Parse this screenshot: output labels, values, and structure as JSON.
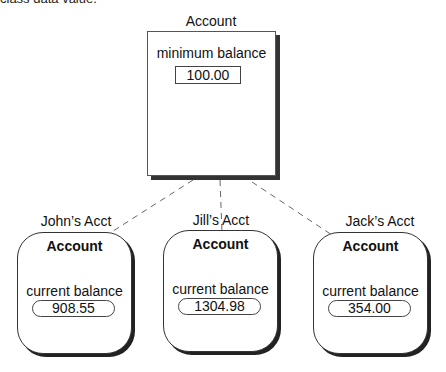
{
  "caption_fragment": "class data value.",
  "class": {
    "name": "Account",
    "attribute_label": "minimum balance",
    "attribute_value": "100.00"
  },
  "objects": [
    {
      "label": "John’s Acct",
      "class_name": "Account",
      "attribute_label": "current balance",
      "attribute_value": "908.55"
    },
    {
      "label": "Jill’s Acct",
      "class_name": "Account",
      "attribute_label": "current balance",
      "attribute_value": "1304.98"
    },
    {
      "label": "Jack’s Acct",
      "class_name": "Account",
      "attribute_label": "current balance",
      "attribute_value": "354.00"
    }
  ],
  "colors": {
    "line": "#555555",
    "shadow": "#222222",
    "background": "#ffffff"
  }
}
